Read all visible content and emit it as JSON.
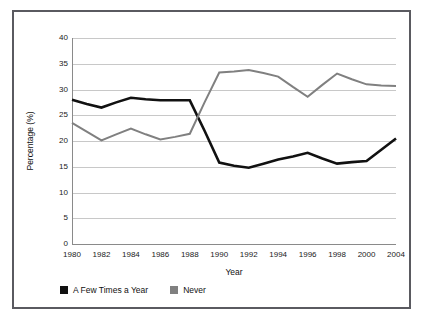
{
  "figure": {
    "border_color": "#5a5a60",
    "background": "#ffffff"
  },
  "axis": {
    "y_title": "Percentage (%)",
    "x_title": "Year",
    "y_ticks": [
      "0",
      "5",
      "10",
      "15",
      "20",
      "25",
      "30",
      "35",
      "40"
    ],
    "x_ticks": [
      "1980",
      "1982",
      "1984",
      "1986",
      "1988",
      "1990",
      "1992",
      "1994",
      "1996",
      "1998",
      "2000",
      "2004"
    ]
  },
  "legend": {
    "items": [
      {
        "label": "A Few Times a Year",
        "color": "#111111"
      },
      {
        "label": "Never",
        "color": "#808080"
      }
    ]
  },
  "chart_data": {
    "type": "line",
    "title": "",
    "subtitle": "",
    "xlabel": "Year",
    "ylabel": "Percentage (%)",
    "xlim": [
      1980,
      2004
    ],
    "ylim": [
      0,
      40
    ],
    "y_tick_step": 5,
    "grid": "horizontal",
    "legend_position": "bottom-left",
    "x": [
      1980,
      1981,
      1982,
      1983,
      1984,
      1985,
      1986,
      1987,
      1988,
      1989,
      1990,
      1991,
      1992,
      1993,
      1994,
      1995,
      1996,
      1997,
      1998,
      1999,
      2000,
      2002,
      2004
    ],
    "x_tick_labels": [
      "1980",
      "1982",
      "1984",
      "1986",
      "1988",
      "1990",
      "1992",
      "1994",
      "1996",
      "1998",
      "2000",
      "2004"
    ],
    "series": [
      {
        "name": "A Few Times a Year",
        "color": "#111111",
        "line_width": 2.6,
        "values": [
          28.0,
          27.2,
          26.5,
          27.5,
          28.4,
          28.1,
          27.9,
          27.9,
          27.9,
          22.0,
          15.8,
          15.2,
          14.8,
          15.6,
          16.4,
          17.0,
          17.7,
          16.6,
          15.6,
          15.9,
          16.1,
          18.3,
          20.5
        ]
      },
      {
        "name": "Never",
        "color": "#808080",
        "line_width": 2.0,
        "values": [
          23.5,
          21.8,
          20.1,
          21.3,
          22.4,
          21.3,
          20.3,
          20.8,
          21.4,
          27.5,
          33.3,
          33.5,
          33.8,
          33.2,
          32.5,
          30.5,
          28.6,
          30.9,
          33.1,
          32.0,
          31.0,
          30.8,
          30.7
        ]
      }
    ]
  }
}
